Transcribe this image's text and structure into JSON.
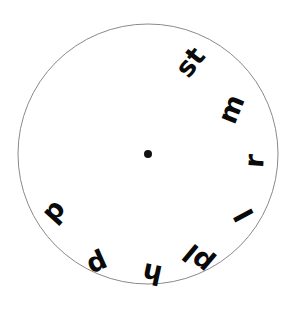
{
  "figure": {
    "type": "word-wheel-diagram",
    "background_color": "#ffffff"
  },
  "circle": {
    "center_x": 148,
    "center_y": 154,
    "radius": 130,
    "stroke_color": "#8a8a8a",
    "stroke_width": 1,
    "fill_color": "#ffffff"
  },
  "center_dot": {
    "label": "center-dot",
    "x": 148,
    "y": 154,
    "radius": 4,
    "color": "#111111"
  },
  "labels": [
    {
      "text": "st",
      "x": 190,
      "y": 62,
      "rotation": -52,
      "size": 27
    },
    {
      "text": "m",
      "x": 231,
      "y": 109,
      "rotation": -68,
      "size": 27
    },
    {
      "text": "r",
      "x": 254,
      "y": 161,
      "rotation": -86,
      "size": 27
    },
    {
      "text": "l",
      "x": 244,
      "y": 215,
      "rotation": -118,
      "size": 27
    },
    {
      "text": "pl",
      "x": 198,
      "y": 259,
      "rotation": -140,
      "size": 27
    },
    {
      "text": "h",
      "x": 152,
      "y": 274,
      "rotation": -168,
      "size": 27
    },
    {
      "text": "p",
      "x": 98,
      "y": 265,
      "rotation": -204,
      "size": 27
    },
    {
      "text": "d",
      "x": 56,
      "y": 213,
      "rotation": -228,
      "size": 27
    }
  ]
}
